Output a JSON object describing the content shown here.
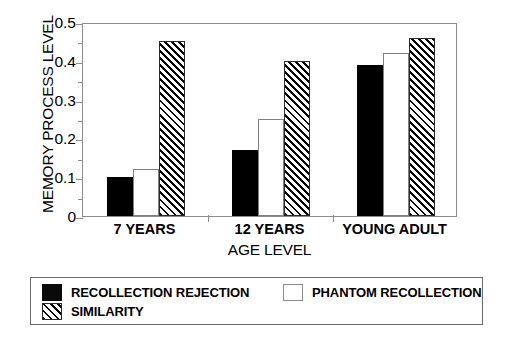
{
  "chart_data": {
    "type": "bar",
    "title": "",
    "xlabel": "AGE LEVEL",
    "ylabel": "MEMORY PROCESS LEVEL",
    "categories": [
      "7 YEARS",
      "12 YEARS",
      "YOUNG ADULT"
    ],
    "series": [
      {
        "name": "RECOLLECTION REJECTION",
        "fill": "solid-black",
        "color": "#000000",
        "values": [
          0.1,
          0.17,
          0.39
        ]
      },
      {
        "name": "PHANTOM RECOLLECTION",
        "fill": "white",
        "color": "#ffffff",
        "values": [
          0.12,
          0.25,
          0.42
        ]
      },
      {
        "name": "SIMILARITY",
        "fill": "diagonal-hatch",
        "color": "#000000",
        "values": [
          0.45,
          0.4,
          0.46
        ]
      }
    ],
    "ylim": [
      0,
      0.5
    ],
    "ytick_values": [
      0,
      0.1,
      0.2,
      0.3,
      0.4,
      0.5
    ],
    "ytick_labels": [
      "0",
      "0.1",
      "0.2",
      "0.3",
      "0.4",
      "0.5"
    ],
    "yminor_values": [
      0.05,
      0.15,
      0.25,
      0.35,
      0.45
    ],
    "grid": false,
    "legend_position": "below-plot",
    "legend_entries": [
      "RECOLLECTION REJECTION",
      "PHANTOM RECOLLECTION",
      "SIMILARITY"
    ]
  }
}
